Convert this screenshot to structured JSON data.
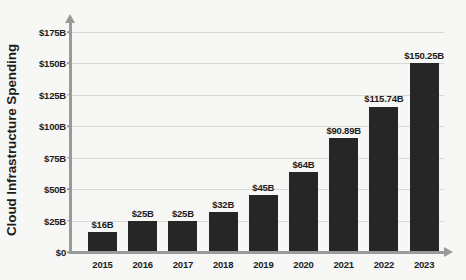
{
  "chart_data": {
    "type": "bar",
    "title": "",
    "xlabel": "",
    "ylabel": "Cloud Infrastructure Spending",
    "categories": [
      "2015",
      "2016",
      "2017",
      "2018",
      "2019",
      "2020",
      "2021",
      "2022",
      "2023"
    ],
    "values": [
      16,
      25,
      25,
      32,
      45,
      64,
      90.89,
      115.74,
      150.25
    ],
    "data_labels": [
      "$16B",
      "$25B",
      "$25B",
      "$32B",
      "$45B",
      "$64B",
      "$90.89B",
      "$115.74B",
      "$150.25B"
    ],
    "ylim": [
      0,
      175
    ],
    "ytick_values": [
      0,
      25,
      50,
      75,
      100,
      125,
      150,
      175
    ],
    "ytick_labels": [
      "$0",
      "$25B",
      "$50B",
      "$75B",
      "$100B",
      "$125B",
      "$150B",
      "$175B"
    ],
    "grid": true,
    "legend": "none",
    "colors": {
      "bar": "#262626",
      "background": "#f7f7f5",
      "grid": "#d8d8d6",
      "axis": "#9a9a98",
      "text": "#1c1c1c"
    }
  }
}
